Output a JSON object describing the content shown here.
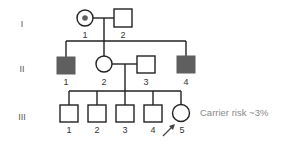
{
  "diagram": {
    "type": "pedigree",
    "colors": {
      "line": "#222222",
      "affected": "#5f5f5f",
      "note": "#8a8a8a"
    },
    "generations": [
      {
        "label": "I",
        "individuals": [
          {
            "id": "1",
            "sex": "female",
            "status": "carrier"
          },
          {
            "id": "2",
            "sex": "male",
            "status": "unaffected"
          }
        ]
      },
      {
        "label": "II",
        "individuals": [
          {
            "id": "1",
            "sex": "male",
            "status": "affected"
          },
          {
            "id": "2",
            "sex": "female",
            "status": "unaffected"
          },
          {
            "id": "3",
            "sex": "male",
            "status": "unaffected"
          },
          {
            "id": "4",
            "sex": "male",
            "status": "affected"
          }
        ]
      },
      {
        "label": "III",
        "individuals": [
          {
            "id": "1",
            "sex": "male",
            "status": "unaffected"
          },
          {
            "id": "2",
            "sex": "male",
            "status": "unaffected"
          },
          {
            "id": "3",
            "sex": "male",
            "status": "unaffected"
          },
          {
            "id": "4",
            "sex": "male",
            "status": "unaffected"
          },
          {
            "id": "5",
            "sex": "female",
            "status": "unaffected",
            "proband": true
          }
        ]
      }
    ],
    "proband_note": "Carrier risk ~3%",
    "proband_arrow": "arrow-icon"
  }
}
